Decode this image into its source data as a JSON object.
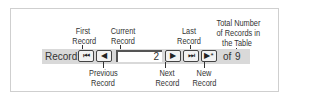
{
  "diagram": {
    "callouts_top": [
      {
        "id": "first",
        "lines": [
          "First",
          "Record"
        ]
      },
      {
        "id": "current",
        "lines": [
          "Current",
          "Record"
        ]
      },
      {
        "id": "last",
        "lines": [
          "Last",
          "Record"
        ]
      },
      {
        "id": "total",
        "lines": [
          "Total Number",
          "of Records in",
          "the Table"
        ]
      }
    ],
    "callouts_bottom": [
      {
        "id": "previous",
        "lines": [
          "Previous",
          "Record"
        ]
      },
      {
        "id": "next",
        "lines": [
          "Next",
          "Record"
        ]
      },
      {
        "id": "new",
        "lines": [
          "New",
          "Record"
        ]
      }
    ]
  },
  "navigator": {
    "label": "Record:",
    "current_record": "2",
    "of_label": "of",
    "total_records": "9",
    "buttons": {
      "first": "⏮",
      "previous": "◀",
      "next": "▶",
      "last": "⏭",
      "new": "▶*"
    }
  }
}
